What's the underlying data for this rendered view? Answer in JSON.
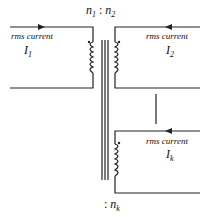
{
  "ratio_top": {
    "n1": "n",
    "n1_sub": "1",
    "sep": ":",
    "n2": "n",
    "n2_sub": "2"
  },
  "ratio_bottom": {
    "sep": ":",
    "nk": "n",
    "nk_sub": "k"
  },
  "windings": [
    {
      "label": "rms current",
      "current": "I",
      "current_sub": "1"
    },
    {
      "label": "rms current",
      "current": "I",
      "current_sub": "2"
    },
    {
      "label": "rms current",
      "current": "I",
      "current_sub": "k"
    }
  ]
}
